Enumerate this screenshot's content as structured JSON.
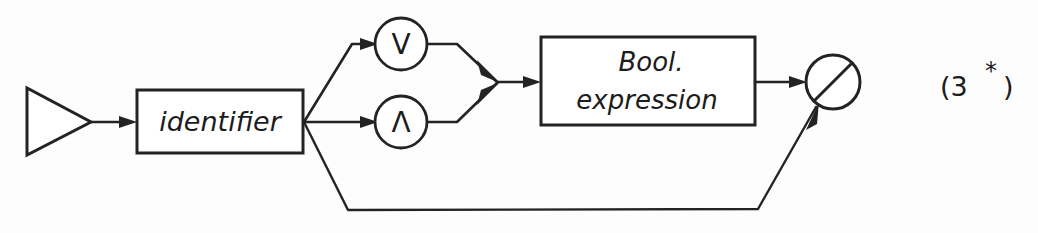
{
  "diagram": {
    "rule_number": "(3",
    "rule_star": "*",
    "rule_close": ")",
    "ink_color": "#232323",
    "paper_color": "#fdfdfd",
    "nodes": {
      "start_triangle": {
        "name": "start-triangle",
        "label": ""
      },
      "identifier_box": {
        "name": "identifier-box",
        "label": "identifier"
      },
      "or_circle": {
        "name": "or-operator-circle",
        "label": "V"
      },
      "and_circle": {
        "name": "and-operator-circle",
        "label": "Λ"
      },
      "bool_expression_box": {
        "name": "bool-expression-box",
        "line1": "Bool.",
        "line2": "expression"
      },
      "end_circle": {
        "name": "end-crossed-circle",
        "label": ""
      }
    },
    "edges": [
      {
        "name": "edge-start-to-identifier",
        "from": "start_triangle",
        "to": "identifier_box"
      },
      {
        "name": "edge-identifier-to-or",
        "from": "identifier_box",
        "to": "or_circle"
      },
      {
        "name": "edge-identifier-to-and",
        "from": "identifier_box",
        "to": "and_circle"
      },
      {
        "name": "edge-identifier-bypass",
        "from": "identifier_box",
        "to": "end_circle"
      },
      {
        "name": "edge-or-to-merge",
        "from": "or_circle",
        "to": "merge_point"
      },
      {
        "name": "edge-and-to-merge",
        "from": "and_circle",
        "to": "merge_point"
      },
      {
        "name": "edge-merge-to-bool",
        "from": "merge_point",
        "to": "bool_expression_box"
      },
      {
        "name": "edge-bool-to-end",
        "from": "bool_expression_box",
        "to": "end_circle"
      }
    ]
  }
}
